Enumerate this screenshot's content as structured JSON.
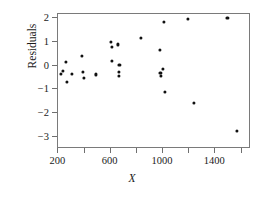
{
  "chart_data": {
    "type": "scatter",
    "title": "",
    "xlabel": "X",
    "ylabel": "Residuals",
    "xlim": [
      150,
      1620
    ],
    "ylim": [
      -3.3,
      2.25
    ],
    "grid": false,
    "legend": null,
    "xticks": [
      200,
      400,
      600,
      800,
      1000,
      1200,
      1400,
      1600
    ],
    "xtick_labels": [
      "200",
      "",
      "600",
      "",
      "1000",
      "",
      "1400",
      ""
    ],
    "yticks": [
      2,
      1,
      0,
      -1,
      -2,
      -3
    ],
    "ytick_labels": [
      "2",
      "1",
      "0",
      "−1",
      "−2",
      "−3"
    ],
    "marker": "filled-circle",
    "marker_color": "#111111",
    "points": [
      {
        "x": 228,
        "y": -0.38
      },
      {
        "x": 245,
        "y": -0.28
      },
      {
        "x": 268,
        "y": 0.1
      },
      {
        "x": 272,
        "y": -0.73
      },
      {
        "x": 315,
        "y": -0.38
      },
      {
        "x": 388,
        "y": 0.35
      },
      {
        "x": 397,
        "y": -0.3
      },
      {
        "x": 404,
        "y": -0.55
      },
      {
        "x": 492,
        "y": -0.41
      },
      {
        "x": 610,
        "y": 0.97
      },
      {
        "x": 615,
        "y": 0.76
      },
      {
        "x": 618,
        "y": 0.17
      },
      {
        "x": 662,
        "y": 0.85
      },
      {
        "x": 668,
        "y": -0.3
      },
      {
        "x": 670,
        "y": -0.46
      },
      {
        "x": 675,
        "y": -0.02
      },
      {
        "x": 842,
        "y": 1.13
      },
      {
        "x": 982,
        "y": 0.6
      },
      {
        "x": 988,
        "y": -0.36
      },
      {
        "x": 995,
        "y": -0.46
      },
      {
        "x": 1008,
        "y": -0.18
      },
      {
        "x": 1012,
        "y": 1.79
      },
      {
        "x": 1020,
        "y": -1.15
      },
      {
        "x": 1200,
        "y": 1.91
      },
      {
        "x": 1245,
        "y": -1.62
      },
      {
        "x": 1500,
        "y": 1.95
      },
      {
        "x": 1575,
        "y": -2.8
      }
    ]
  }
}
